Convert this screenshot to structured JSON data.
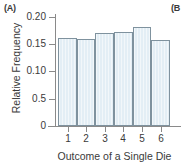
{
  "panels": {
    "left_label": "(A)",
    "right_label": "(B"
  },
  "chart_data": {
    "type": "bar",
    "title": "",
    "xlabel": "Outcome of a Single Die",
    "ylabel": "Relative Frequency",
    "categories": [
      "1",
      "2",
      "3",
      "4",
      "5",
      "6"
    ],
    "values": [
      0.161,
      0.159,
      0.171,
      0.172,
      0.181,
      0.157
    ],
    "ylim": [
      0,
      0.205
    ],
    "ytick_values": [
      0.2,
      0.15,
      0.1,
      0.05,
      0
    ],
    "ytick_labels": [
      "0.20",
      "0.15",
      "0.10",
      "0.5",
      "0"
    ],
    "grid": false,
    "legend": null,
    "bar_fill_color": "#e3eef5",
    "bar_border_color": "#7f929e",
    "axis_color": "#8a8a8a"
  }
}
